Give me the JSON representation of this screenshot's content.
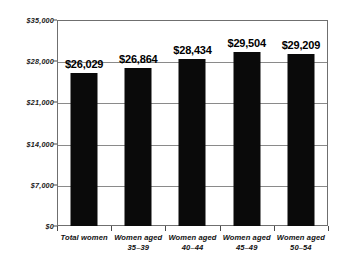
{
  "chart_data": {
    "type": "bar",
    "title": "",
    "subtitle": "",
    "xlabel": "",
    "ylabel": "",
    "categories": [
      "Total women",
      "Women aged 35–39",
      "Women aged 40–44",
      "Women aged 45–49",
      "Women aged 50–54"
    ],
    "category_lines": [
      [
        "Total women",
        ""
      ],
      [
        "Women aged",
        "35–39"
      ],
      [
        "Women aged",
        "40–44"
      ],
      [
        "Women aged",
        "45–49"
      ],
      [
        "Women aged",
        "50–54"
      ]
    ],
    "values": [
      26029,
      26864,
      28434,
      29504,
      29209
    ],
    "value_labels": [
      "$26,029",
      "$26,864",
      "$28,434",
      "$29,504",
      "$29,209"
    ],
    "ylim": [
      0,
      35000
    ],
    "ytick_values": [
      0,
      7000,
      14000,
      21000,
      28000,
      35000
    ],
    "ytick_labels": [
      "$0",
      "$7,000",
      "$14,000",
      "$21,000",
      "$28,000",
      "$35,000"
    ],
    "grid": true,
    "legend": null,
    "bar_color": "#0a0a0a",
    "grid_color": "#8a8a8a",
    "frame_color": "#6f6f6f",
    "background_color": "#ffffff"
  }
}
